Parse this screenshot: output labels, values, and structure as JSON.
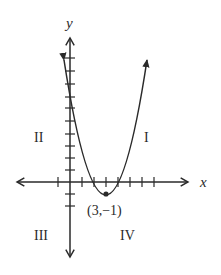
{
  "diagram": {
    "type": "parabola-on-coordinate-plane",
    "axes": {
      "x_label": "x",
      "y_label": "y"
    },
    "quadrants": [
      "I",
      "II",
      "III",
      "IV"
    ],
    "vertex": {
      "label": "(3,−1)",
      "x": 3,
      "y": -1
    },
    "colors": {
      "stroke": "#2a2a2a",
      "background": "#ffffff"
    }
  }
}
